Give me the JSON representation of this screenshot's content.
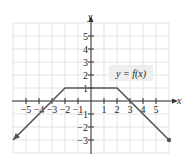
{
  "chart_data": {
    "type": "line",
    "title": "",
    "xlabel": "x",
    "ylabel": "y",
    "xlim": [
      -6,
      6
    ],
    "ylim": [
      -4,
      6
    ],
    "grid": true,
    "x_ticks": [
      "-5",
      "-4",
      "-3",
      "-2",
      "-1",
      "1",
      "2",
      "3",
      "4",
      "5"
    ],
    "y_ticks": [
      "5",
      "4",
      "3",
      "2",
      "1",
      "-1",
      "-2",
      "-3"
    ],
    "series": [
      {
        "name": "y = f(x)",
        "points": [
          [
            -6,
            -3
          ],
          [
            -2,
            1
          ],
          [
            2,
            1
          ],
          [
            6,
            -3
          ]
        ],
        "left_end": "arrow",
        "right_end": "closed-dot"
      }
    ],
    "annotations": [
      {
        "text": "y = f(x)",
        "x": 3.2,
        "y": 2
      }
    ]
  },
  "labels": {
    "x_axis": "x",
    "y_axis": "y",
    "function": "y = f(x)"
  },
  "colors": {
    "grid": "#dcdcdc",
    "axis": "#333333",
    "curve": "#555555",
    "label_bg": "#eeeeee"
  }
}
